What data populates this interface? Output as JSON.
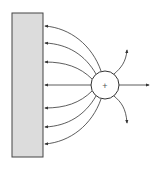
{
  "diagram": {
    "colors": {
      "background": "#ffffff",
      "plate_fill": "#dcdcdc",
      "stroke": "#333333"
    },
    "plate": {
      "x": 12,
      "y": 13,
      "width": 31,
      "height": 144
    },
    "charge": {
      "cx": 105,
      "cy": 85,
      "r": 14,
      "sign": "+"
    },
    "plate_lines_y": [
      26,
      43,
      62,
      85,
      108,
      127,
      144
    ],
    "outward_lines": [
      {
        "direction": "up",
        "end": [
          127,
          49
        ]
      },
      {
        "direction": "right",
        "end": [
          150,
          85
        ]
      },
      {
        "direction": "down",
        "end": [
          127,
          124
        ]
      }
    ]
  }
}
